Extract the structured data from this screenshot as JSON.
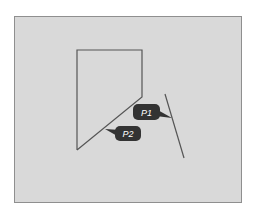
{
  "diagram": {
    "panel": {
      "fill": "#d9d9d9",
      "border": "#8f8f8f"
    },
    "shape": {
      "name": "pentagon",
      "stroke": "#555555",
      "points": [
        [
          77,
          50
        ],
        [
          142,
          50
        ],
        [
          142,
          97
        ],
        [
          77,
          150
        ]
      ]
    },
    "line": {
      "stroke": "#555555",
      "from": [
        165,
        94
      ],
      "to": [
        184,
        158
      ]
    },
    "callouts": [
      {
        "label": "P1",
        "fill": "#333333",
        "text_color": "#ffffff"
      },
      {
        "label": "P2",
        "fill": "#333333",
        "text_color": "#ffffff"
      }
    ]
  }
}
